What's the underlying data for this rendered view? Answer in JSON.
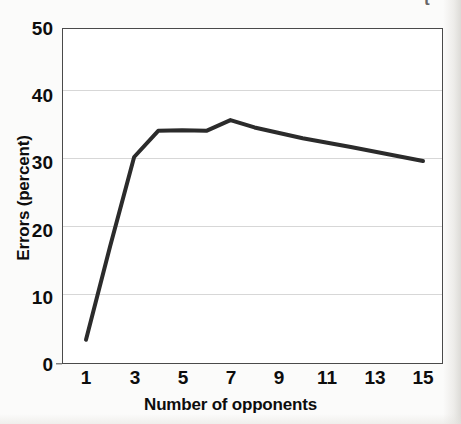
{
  "chart_data": {
    "type": "line",
    "title": "",
    "xlabel": "Number of opponents",
    "ylabel": "Errors (percent)",
    "xlim": [
      1,
      15
    ],
    "ylim": [
      0,
      50
    ],
    "grid": true,
    "grid_axis": "y",
    "legend": false,
    "legend_position": "none",
    "xtick_labels": [
      "1",
      "3",
      "5",
      "7",
      "9",
      "11",
      "13",
      "15"
    ],
    "xtick_values": [
      1,
      3,
      5,
      7,
      9,
      11,
      13,
      15
    ],
    "ytick_labels": [
      "0",
      "10",
      "20",
      "30",
      "40",
      "50"
    ],
    "ytick_values": [
      0,
      10,
      20,
      30,
      40,
      50
    ],
    "series": [
      {
        "name": "Errors",
        "color": "#2b2b2b",
        "line_width": 4,
        "x": [
          1,
          2,
          3,
          4,
          5,
          6,
          7,
          8,
          10,
          12,
          15
        ],
        "values": [
          3.6,
          17.5,
          30.8,
          34.7,
          34.8,
          34.7,
          36.3,
          35.2,
          33.6,
          32.3,
          30.2
        ]
      }
    ],
    "annotations": []
  },
  "figure": {
    "corner_fragment": "t",
    "axis_color": "#4a4a4a",
    "grid_color": "#d7d7d7",
    "plot_background": "#ffffff",
    "page_background": "#fbfbfa"
  }
}
